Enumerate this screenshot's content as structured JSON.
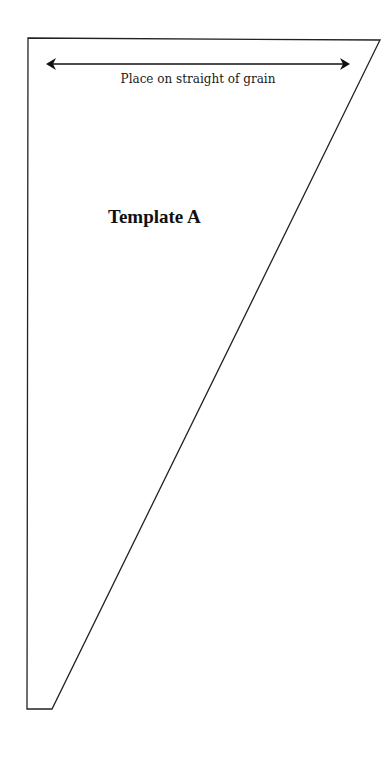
{
  "pattern": {
    "title": "Template A",
    "grain_line_label": "Place on straight of grain",
    "outline": {
      "points": [
        [
          28,
          38
        ],
        [
          380,
          40
        ],
        [
          52,
          709
        ],
        [
          27,
          709
        ]
      ],
      "stroke": "#222222"
    },
    "grain_arrow": {
      "x1": 46,
      "x2": 350,
      "y": 64
    }
  }
}
